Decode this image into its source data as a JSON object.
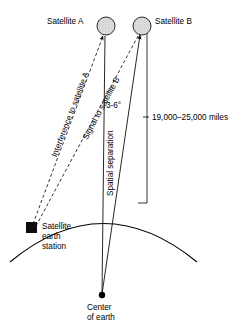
{
  "diagram": {
    "labels": {
      "satellite_a": "Satellite A",
      "satellite_b": "Satellite B",
      "interference_path": "Interference to satellite A",
      "signal_path": "Signal to satellite B",
      "angle": "3-6°",
      "spatial_separation": "Spatial separation",
      "altitude_range": "19,000–25,000 miles",
      "earth_station_line1": "Satellite",
      "earth_station_line2": "earth",
      "earth_station_line3": "station",
      "center_line1": "Center",
      "center_line2": "of earth"
    },
    "colors": {
      "ink": "#000000",
      "satellite_fill": "#d6d6d6",
      "background": "#ffffff"
    },
    "values": {
      "angle_min_deg": 3,
      "angle_max_deg": 6,
      "altitude_min_miles": 19000,
      "altitude_max_miles": 25000
    },
    "icons": {
      "satellite_a": "satellite-circle-icon",
      "satellite_b": "satellite-circle-icon",
      "earth_station": "earth-station-square-icon",
      "center_of_earth": "center-dot-icon"
    }
  }
}
